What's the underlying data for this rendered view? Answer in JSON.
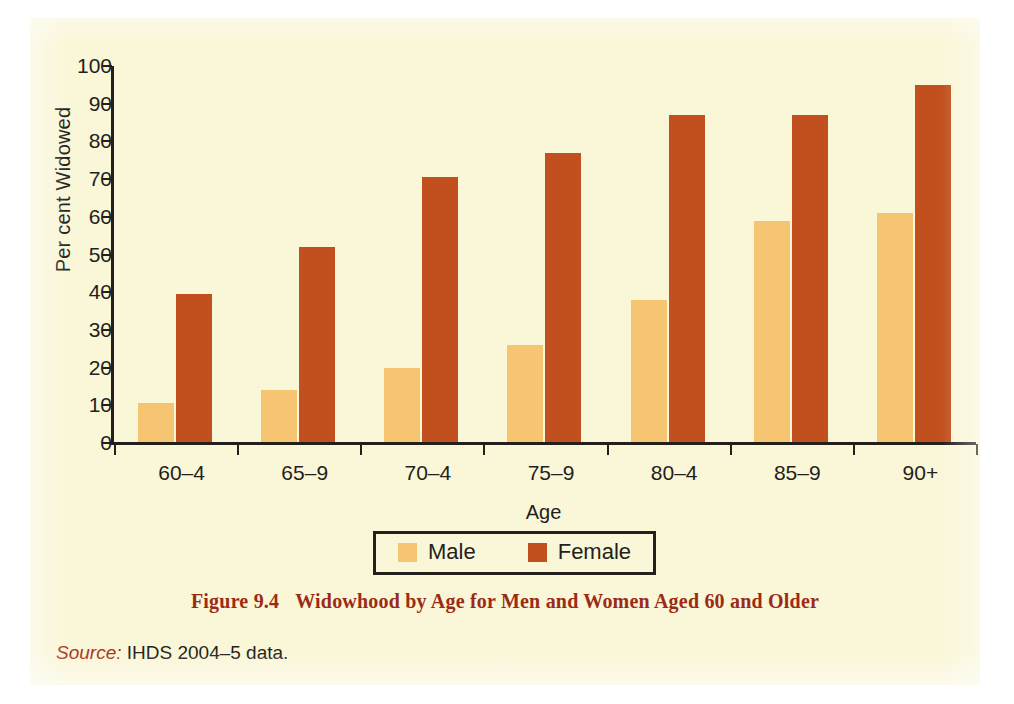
{
  "figure": {
    "caption_number": "Figure 9.4",
    "caption_text": "Widowhood by Age for Men and Women Aged 60 and Older",
    "source_label": "Source:",
    "source_text": "IHDS 2004–5 data."
  },
  "colors": {
    "page_background": "#faf6d8",
    "male": "#f6c571",
    "female": "#c2501f",
    "axis": "#231f1a",
    "caption": "#9c2b16",
    "source_label": "#a8321b"
  },
  "legend": {
    "items": [
      {
        "label": "Male",
        "color": "#f6c571"
      },
      {
        "label": "Female",
        "color": "#c2501f"
      }
    ]
  },
  "chart_data": {
    "type": "bar",
    "title": "Widowhood by Age for Men and Women Aged 60 and Older",
    "subtitle": "",
    "xlabel": "Age",
    "ylabel": "Per cent Widowed",
    "categories": [
      "60–4",
      "65–9",
      "70–4",
      "75–9",
      "80–4",
      "85–9",
      "90+"
    ],
    "series": [
      {
        "name": "Male",
        "color": "#f6c571",
        "values": [
          10.5,
          14,
          20,
          26,
          38,
          59,
          61
        ]
      },
      {
        "name": "Female",
        "color": "#c2501f",
        "values": [
          39.5,
          52,
          70.5,
          77,
          87,
          87,
          95
        ]
      }
    ],
    "ylim": [
      0,
      100
    ],
    "ytick_step": 10,
    "yticks": [
      0,
      10,
      20,
      30,
      40,
      50,
      60,
      70,
      80,
      90,
      100
    ],
    "ytick_labels": [
      "0",
      "10",
      "20",
      "30",
      "40",
      "50",
      "60",
      "70",
      "80",
      "90",
      "100"
    ],
    "grid": false,
    "legend_position": "bottom-center",
    "grouped": true
  }
}
